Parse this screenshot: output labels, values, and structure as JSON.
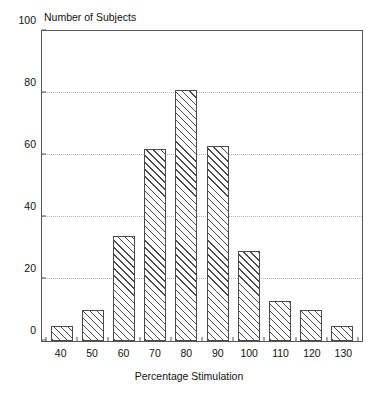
{
  "chart_data": {
    "type": "bar",
    "title": "Number of Subjects",
    "ylabel": "Number of Subjects",
    "xlabel": "Percentage Stimulation",
    "categories": [
      "40",
      "50",
      "60",
      "70",
      "80",
      "90",
      "100",
      "110",
      "120",
      "130"
    ],
    "values": [
      5,
      10,
      34,
      62,
      81,
      63,
      29,
      13,
      10,
      5
    ],
    "ylim": [
      0,
      100
    ],
    "yticks": [
      0,
      20,
      40,
      60,
      80,
      100
    ],
    "ytick_labels": [
      "0",
      "20",
      "40",
      "60",
      "80",
      "100"
    ],
    "gridlines": [
      20,
      40,
      60,
      80
    ],
    "grid": true,
    "legend": null,
    "bar_fill": "diagonal-hatch",
    "bar_edge_color": "#4a4a4a",
    "frame_color": "#555555",
    "background": "#ffffff"
  },
  "caption": {
    "text": ""
  }
}
